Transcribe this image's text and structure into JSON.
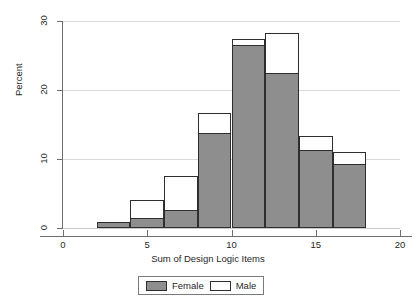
{
  "chart_data": {
    "type": "bar",
    "title": "",
    "subtitle": "",
    "xlabel": "Sum of Design Logic Items",
    "ylabel": "Percent",
    "xlim": [
      0,
      20
    ],
    "ylim": [
      0,
      30
    ],
    "xticks": [
      0,
      5,
      10,
      15,
      20
    ],
    "xtick_labels": [
      "0",
      "5",
      "10",
      "15",
      "20"
    ],
    "yticks": [
      0,
      10,
      20,
      30
    ],
    "ytick_labels": [
      "0",
      "10",
      "20",
      "30"
    ],
    "grid": "horizontal",
    "bar_mode": "overlay",
    "bin_width": 2,
    "bin_starts": [
      2,
      4,
      6,
      8,
      10,
      12,
      14,
      16
    ],
    "bin_labels": [
      "2-4",
      "4-6",
      "6-8",
      "8-10",
      "10-12",
      "12-14",
      "14-16",
      "16-18"
    ],
    "legend_position": "bottom-center",
    "series": [
      {
        "name": "Male",
        "color": "#ffffff",
        "edge_color": "#2e2e2e",
        "values": [
          0.9,
          4.0,
          7.6,
          16.7,
          27.4,
          28.3,
          13.4,
          11.0
        ]
      },
      {
        "name": "Female",
        "color": "#8e8e8e",
        "edge_color": "#2e2e2e",
        "values": [
          0.9,
          1.5,
          2.6,
          13.8,
          26.5,
          22.5,
          11.3,
          9.3
        ]
      }
    ]
  },
  "legend": {
    "items": [
      {
        "label": "Female",
        "swatch": "female"
      },
      {
        "label": "Male",
        "swatch": "male"
      }
    ]
  },
  "colors": {
    "female_fill": "#8e8e8e",
    "male_fill": "#ffffff",
    "bar_edge": "#2e2e2e",
    "gridline": "#d9d9d9",
    "axis": "#6d6d6d",
    "text": "#1f1f1f",
    "background": "#ffffff"
  }
}
